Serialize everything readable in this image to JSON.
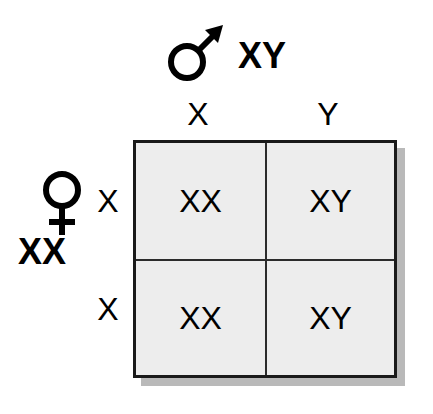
{
  "diagram": {
    "background_color": "#ffffff",
    "cell_fill_color": "#ededed",
    "border_color": "#1a1a1a",
    "shadow_color": "#b9b9b9",
    "text_color": "#000000"
  },
  "parents": {
    "male": {
      "symbol_name": "male-symbol",
      "symbol_glyph": "♂",
      "genotype": "XY",
      "gametes": [
        "X",
        "Y"
      ]
    },
    "female": {
      "symbol_name": "female-symbol",
      "symbol_glyph": "♀",
      "genotype": "XX",
      "gametes": [
        "X",
        "X"
      ]
    }
  },
  "punnett": {
    "column_headers": [
      "X",
      "Y"
    ],
    "row_headers": [
      "X",
      "X"
    ],
    "cells": [
      [
        "XX",
        "XY"
      ],
      [
        "XX",
        "XY"
      ]
    ]
  }
}
